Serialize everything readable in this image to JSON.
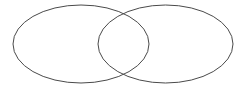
{
  "figure": {
    "name": "venn-diagram",
    "type": "venn-2-set",
    "title": "",
    "background_color": "#ffffff",
    "canvas": {
      "width": 246,
      "height": 92
    },
    "stroke": {
      "color": "#4a4a4a",
      "width": 1,
      "fill": "none"
    },
    "shapes": [
      {
        "id": "left-ellipse",
        "label": "",
        "cx": 81,
        "cy": 44,
        "rx": 68,
        "ry": 39,
        "fill": "none",
        "stroke_color": "#4a4a4a"
      },
      {
        "id": "right-ellipse",
        "label": "",
        "cx": 165.5,
        "cy": 44,
        "rx": 67.5,
        "ry": 39,
        "fill": "none",
        "stroke_color": "#4a4a4a"
      }
    ],
    "intersection": {
      "id": "overlap-lens",
      "label": "",
      "top_point": {
        "x": 122,
        "y": 13
      },
      "bottom_point": {
        "x": 123,
        "y": 78
      },
      "left_bound": 98,
      "right_bound": 149
    },
    "labels": []
  }
}
